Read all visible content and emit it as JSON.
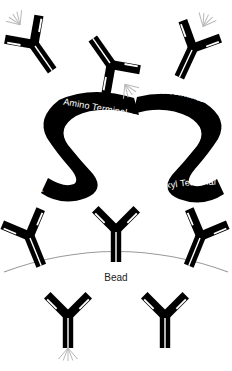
{
  "figure": {
    "background_color": "#ffffff",
    "ink_color": "#000000",
    "ray_color": "#b8b8b8",
    "arc_color": "#9a9a9a",
    "label_text_color": "#ffffff"
  },
  "labels": {
    "amino_terminal_left": "Amino Terminal",
    "amino_terminal_right": "Amino Terminal",
    "carboxyl_terminal_left": "Carboxyl Terminal",
    "carboxyl_terminal_right": "Carboxyl Terminal",
    "bead": "Bead"
  },
  "antibodies": [
    {
      "id": "antibody-top-left",
      "label": "antibody",
      "rotation_deg": -35,
      "has_rays": true
    },
    {
      "id": "antibody-top-center",
      "label": "antibody",
      "rotation_deg": 145,
      "has_rays": true
    },
    {
      "id": "antibody-top-right",
      "label": "antibody",
      "rotation_deg": 25,
      "has_rays": true
    },
    {
      "id": "antibody-bead-left",
      "label": "antibody",
      "rotation_deg": -22,
      "has_rays": false
    },
    {
      "id": "antibody-bead-center",
      "label": "antibody",
      "rotation_deg": 0,
      "has_rays": false
    },
    {
      "id": "antibody-bead-right",
      "label": "antibody",
      "rotation_deg": 22,
      "has_rays": false
    },
    {
      "id": "antibody-bottom-left",
      "label": "antibody",
      "rotation_deg": 0,
      "has_rays": true
    },
    {
      "id": "antibody-bottom-right",
      "label": "antibody",
      "rotation_deg": 0,
      "has_rays": false
    }
  ],
  "ribbons": [
    {
      "id": "ribbon-left",
      "shape": "s-curve",
      "amino_end": "top-right",
      "carboxyl_end": "bottom-left"
    },
    {
      "id": "ribbon-right",
      "shape": "s-curve-mirrored",
      "amino_end": "top-left",
      "carboxyl_end": "bottom-right"
    }
  ],
  "bead": {
    "shape": "arc",
    "caption": "Bead"
  }
}
